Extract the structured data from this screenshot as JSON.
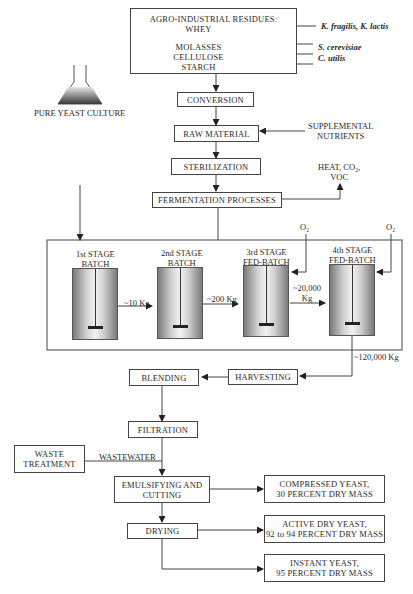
{
  "diagram": {
    "title_box": {
      "heading": "AGRO-INDUSTRIAL RESIDUES:",
      "items": [
        "WHEY",
        "MOLASSES",
        "CELLULOSE",
        "STARCH"
      ]
    },
    "organisms": {
      "whey": "K. fragilis, K. lactis",
      "molasses": "S. cerevisiae",
      "cellulose": "C. utilis"
    },
    "steps": {
      "conversion": "CONVERSION",
      "raw_material": "RAW MATERIAL",
      "supplemental_line1": "SUPPLEMENTAL",
      "supplemental_line2": "NUTRIENTS",
      "sterilization": "STERILIZATION",
      "pure_culture": "PURE YEAST CULTURE",
      "fermentation": "FERMENTATION PROCESSES",
      "emissions_line1": "HEAT, CO₂,",
      "emissions_line2": "VOC",
      "blending": "BLENDING",
      "harvesting": "HARVESTING",
      "filtration": "FILTRATION",
      "waste_line1": "WASTE",
      "waste_line2": "TREATMENT",
      "wastewater": "WASTEWATER",
      "emulsifying_line1": "EMULSIFYING AND",
      "emulsifying_line2": "CUTTING",
      "drying": "DRYING"
    },
    "stages": [
      {
        "line1": "1st STAGE",
        "line2": "BATCH"
      },
      {
        "line1": "2nd STAGE",
        "line2": "BATCH"
      },
      {
        "line1": "3rd STAGE",
        "line2": "FED-BATCH"
      },
      {
        "line1": "4th STAGE",
        "line2": "FED-BATCH"
      }
    ],
    "transfers": {
      "s1_s2": "~10 Kg",
      "s2_s3": "~200 Kg",
      "s3_s4_line1": "~20,000",
      "s3_s4_line2": "Kg",
      "s4_out": "~120,000 Kg"
    },
    "oxygen": "O₂",
    "products": [
      {
        "line1": "COMPRESSED YEAST,",
        "line2": "30 PERCENT DRY MASS"
      },
      {
        "line1": "ACTIVE DRY YEAST,",
        "line2": "92 to 94 PERCENT DRY MASS"
      },
      {
        "line1": "INSTANT YEAST,",
        "line2": "95 PERCENT DRY MASS"
      }
    ]
  }
}
